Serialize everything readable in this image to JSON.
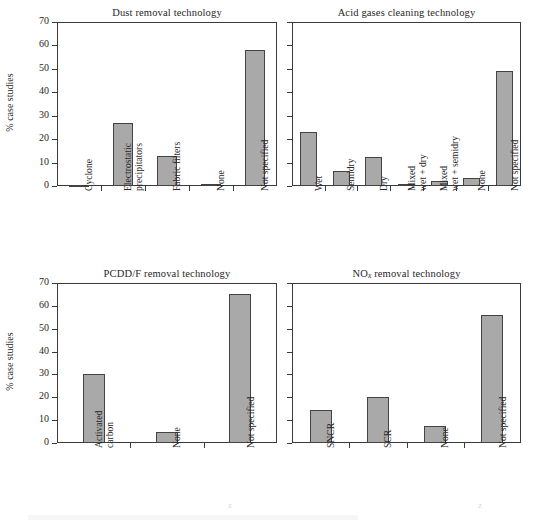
{
  "figure": {
    "background_color": "#ffffff",
    "bar_fill_color": "#a9a9a9",
    "bar_edge_color": "#434343",
    "axis_color": "#3a3a3a",
    "text_color": "#272727"
  },
  "shared": {
    "ylabel": "% case studies",
    "ytick_labels": [
      "0",
      "10",
      "20",
      "30",
      "40",
      "50",
      "60",
      "70"
    ]
  },
  "chart_data": [
    {
      "type": "bar",
      "panel": "top-left",
      "title": "Dust removal technology",
      "title_plain": "Dust removal technology",
      "xlabel": "",
      "ylabel": "% case studies",
      "ylim": [
        0,
        70
      ],
      "yticks": [
        0,
        10,
        20,
        30,
        40,
        50,
        60,
        70
      ],
      "ytick_labels_shown": true,
      "grid": false,
      "legend": "none",
      "categories": [
        "Cyclone",
        "Electrostatic precipitators",
        "Fabric filters",
        "None",
        "Not specified"
      ],
      "category_lines": [
        [
          "Cyclone"
        ],
        [
          "Electrostatic",
          "precipitators"
        ],
        [
          "Fabric filters"
        ],
        [
          "None"
        ],
        [
          "Not specified"
        ]
      ],
      "values": [
        0.6,
        27,
        13,
        0.8,
        58
      ]
    },
    {
      "type": "bar",
      "panel": "top-right",
      "title": "Acid gases cleaning technology",
      "title_plain": "Acid gases cleaning technology",
      "xlabel": "",
      "ylabel": "",
      "ylim": [
        0,
        70
      ],
      "yticks": [
        0,
        10,
        20,
        30,
        40,
        50,
        60,
        70
      ],
      "ytick_labels_shown": false,
      "grid": false,
      "legend": "none",
      "categories": [
        "Wet",
        "Semidry",
        "Dry",
        "Mixed wet + dry",
        "Mixed wet + semidry",
        "None",
        "Not specified"
      ],
      "category_lines": [
        [
          "Wet"
        ],
        [
          "Semidry"
        ],
        [
          "Dry"
        ],
        [
          "Mixed",
          "wet + dry"
        ],
        [
          "Mixed",
          "wet + semidry"
        ],
        [
          "None"
        ],
        [
          "Not specified"
        ]
      ],
      "values": [
        23,
        6.5,
        12.5,
        0.7,
        2,
        3.5,
        49
      ]
    },
    {
      "type": "bar",
      "panel": "bottom-left",
      "title": "PCDD/F removal technology",
      "title_plain": "PCDD/F removal technology",
      "xlabel": "",
      "ylabel": "% case studies",
      "ylim": [
        0,
        70
      ],
      "yticks": [
        0,
        10,
        20,
        30,
        40,
        50,
        60,
        70
      ],
      "ytick_labels_shown": true,
      "grid": false,
      "legend": "none",
      "categories": [
        "Activated carbon",
        "None",
        "Not specified"
      ],
      "category_lines": [
        [
          "Activated",
          "carbon"
        ],
        [
          "None"
        ],
        [
          "Not specified"
        ]
      ],
      "values": [
        30,
        5,
        65
      ]
    },
    {
      "type": "bar",
      "panel": "bottom-right",
      "title": "NOx removal technology",
      "title_plain": "NOx removal technology",
      "title_prefix": "NO",
      "title_subscript": "x",
      "title_suffix": " removal technology",
      "xlabel": "",
      "ylabel": "",
      "ylim": [
        0,
        70
      ],
      "yticks": [
        0,
        10,
        20,
        30,
        40,
        50,
        60,
        70
      ],
      "ytick_labels_shown": false,
      "grid": false,
      "legend": "none",
      "categories": [
        "SNCR",
        "SCR",
        "None",
        "Not specified"
      ],
      "category_lines": [
        [
          "SNCR"
        ],
        [
          "SCR"
        ],
        [
          "None"
        ],
        [
          "Not specified"
        ]
      ],
      "values": [
        14.5,
        20,
        7.5,
        56
      ]
    }
  ]
}
